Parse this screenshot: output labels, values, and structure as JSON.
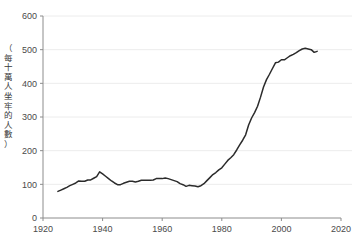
{
  "figure": {
    "title_partial": "",
    "caption_partial": "",
    "background_color": "#ffffff",
    "line_color": "#2b2b2b",
    "grid_color": "#ececec",
    "axis_color": "#8c8c8c",
    "tick_label_color": "#4a4a4a"
  },
  "chart_data": {
    "type": "line",
    "title": "",
    "xlabel": "",
    "ylabel": "（每十萬人坐牢的人數）",
    "ylabel_chars": [
      "（",
      "每",
      "十",
      "萬",
      "人",
      "坐",
      "牢",
      "的",
      "人",
      "數",
      "）"
    ],
    "xlim": [
      1920,
      2020
    ],
    "ylim": [
      0,
      600
    ],
    "xticks": [
      1920,
      1940,
      1960,
      1980,
      2000,
      2020
    ],
    "xtick_labels": [
      "1920",
      "1940",
      "1960",
      "1980",
      "2000",
      "2020"
    ],
    "yticks": [
      0,
      100,
      200,
      300,
      400,
      500,
      600
    ],
    "ytick_labels": [
      "0",
      "100",
      "200",
      "300",
      "400",
      "500",
      "600"
    ],
    "grid": "horizontal",
    "legend": "none",
    "series": [
      {
        "name": "incarceration-rate",
        "x": [
          1925,
          1926,
          1927,
          1928,
          1929,
          1930,
          1931,
          1932,
          1933,
          1934,
          1935,
          1936,
          1937,
          1938,
          1939,
          1940,
          1941,
          1942,
          1943,
          1944,
          1945,
          1946,
          1947,
          1948,
          1949,
          1950,
          1951,
          1952,
          1953,
          1954,
          1955,
          1956,
          1957,
          1958,
          1959,
          1960,
          1961,
          1962,
          1963,
          1964,
          1965,
          1966,
          1967,
          1968,
          1969,
          1970,
          1971,
          1972,
          1973,
          1974,
          1975,
          1976,
          1977,
          1978,
          1979,
          1980,
          1981,
          1982,
          1983,
          1984,
          1985,
          1986,
          1987,
          1988,
          1989,
          1990,
          1991,
          1992,
          1993,
          1994,
          1995,
          1996,
          1997,
          1998,
          1999,
          2000,
          2001,
          2002,
          2003,
          2004,
          2005,
          2006,
          2007,
          2008,
          2009,
          2010,
          2011,
          2012
        ],
        "values": [
          79,
          83,
          87,
          91,
          96,
          100,
          104,
          110,
          109,
          109,
          113,
          113,
          118,
          123,
          137,
          131,
          124,
          117,
          110,
          104,
          99,
          99,
          103,
          106,
          109,
          109,
          107,
          109,
          112,
          112,
          112,
          112,
          113,
          117,
          117,
          117,
          119,
          117,
          114,
          111,
          108,
          102,
          99,
          94,
          97,
          96,
          95,
          93,
          96,
          102,
          111,
          120,
          129,
          135,
          143,
          149,
          160,
          171,
          179,
          188,
          202,
          217,
          231,
          247,
          276,
          297,
          313,
          332,
          359,
          389,
          411,
          427,
          444,
          461,
          463,
          470,
          470,
          476,
          482,
          486,
          491,
          497,
          502,
          504,
          502,
          500,
          492,
          495
        ]
      }
    ]
  }
}
